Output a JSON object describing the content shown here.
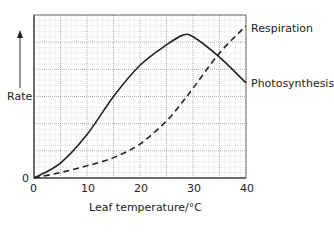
{
  "chart_data": {
    "type": "line",
    "title": "",
    "xlabel": "Leaf temperature/°C",
    "ylabel": "Rate",
    "xlim": [
      0,
      40
    ],
    "ylim": [
      0,
      6
    ],
    "x_ticks": [
      "0",
      "10",
      "20",
      "30",
      "40"
    ],
    "y_ticks": [
      "0"
    ],
    "grid": true,
    "legend_position": "inline-right",
    "x": [
      0,
      5,
      10,
      15,
      20,
      25,
      28,
      30,
      35,
      40
    ],
    "series": [
      {
        "name": "Photosynthesis",
        "style": "solid",
        "values": [
          0,
          0.55,
          1.6,
          3.0,
          4.15,
          4.9,
          5.25,
          5.2,
          4.45,
          3.5
        ]
      },
      {
        "name": "Respiration",
        "style": "dashed",
        "values": [
          0,
          0.2,
          0.45,
          0.75,
          1.25,
          2.1,
          2.8,
          3.3,
          4.6,
          5.6
        ]
      }
    ]
  },
  "labels": {
    "y_axis": "Rate",
    "x_axis": "Leaf temperature/°C",
    "y_zero": "0",
    "x_ticks": [
      "0",
      "10",
      "20",
      "30",
      "40"
    ],
    "respiration": "Respiration",
    "photosynthesis": "Photosynthesis"
  }
}
